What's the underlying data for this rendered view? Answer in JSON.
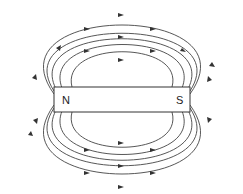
{
  "diagram": {
    "type": "magnetic-field-lines-bar-magnet",
    "magnet": {
      "north_label": "N",
      "south_label": "S",
      "x": 54,
      "y": 87,
      "width": 136,
      "height": 25
    },
    "loops_per_side": 5,
    "colors": {
      "line": "#333333",
      "magnet_fill": "#ffffff",
      "magnet_stroke": "#333333"
    }
  }
}
